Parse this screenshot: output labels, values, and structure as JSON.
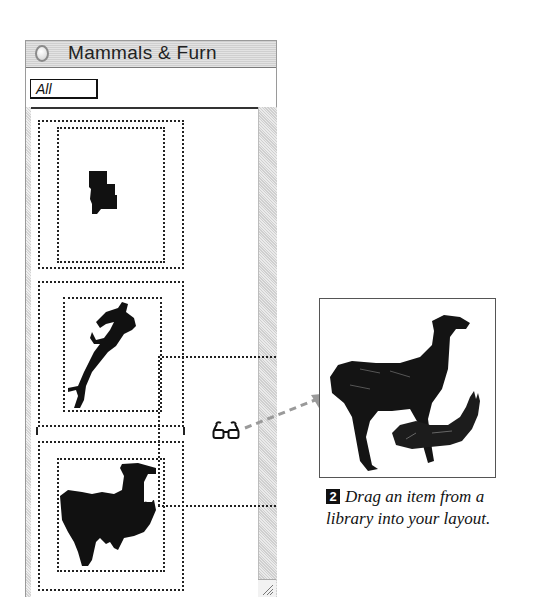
{
  "window": {
    "title": "Mammals & Furn",
    "filter_value": "All",
    "close_icon": "close-box-icon",
    "grow_icon": "resize-grip-icon"
  },
  "library_items": [
    {
      "name": "small-dark-object-thumbnail",
      "icon": "object-silhouette-icon"
    },
    {
      "name": "leaping-deer-thumbnail",
      "icon": "deer-silhouette-icon"
    },
    {
      "name": "llama-thumbnail",
      "icon": "llama-silhouette-icon"
    }
  ],
  "drag": {
    "cursor_icon": "glasses-drag-icon",
    "arrow_icon": "dashed-arrow-icon"
  },
  "preview": {
    "image": "llama-engraving-image"
  },
  "caption": {
    "step_number": "2",
    "line1": "Drag an item from a",
    "line2": "library into your layout."
  },
  "colors": {
    "ink": "#111111",
    "window_border": "#9a9a9a",
    "titlebar": "#d8d8d8",
    "arrow": "#999999"
  }
}
